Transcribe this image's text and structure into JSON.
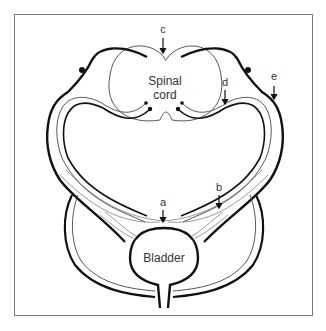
{
  "diagram": {
    "type": "anatomical-schematic",
    "labels": {
      "spinal_cord_line1": "Spinal",
      "spinal_cord_line2": "cord",
      "bladder": "Bladder",
      "a": "a",
      "b": "b",
      "c": "c",
      "d": "d",
      "e": "e"
    },
    "colors": {
      "stroke": "#111111",
      "thin_stroke": "#444444",
      "frame": "#7a7a7a",
      "text": "#333333"
    }
  }
}
